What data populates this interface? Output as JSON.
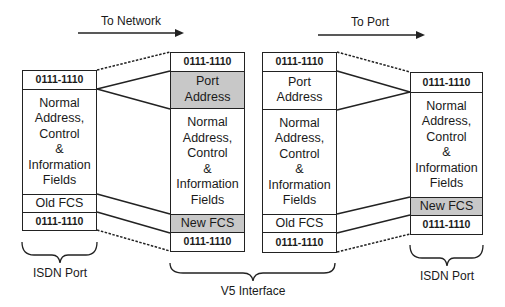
{
  "diagram": {
    "directions": [
      {
        "label": "To Network",
        "arrow": "right"
      },
      {
        "label": "To Port",
        "arrow": "right"
      }
    ],
    "frames": [
      {
        "name": "isdn-port-inbound",
        "fields": [
          {
            "label": "0111-1110",
            "type": "flag"
          },
          {
            "label": "Normal Address, Control & Information Fields",
            "lines": [
              "Normal",
              "Address,",
              "Control",
              "&",
              "Information",
              "Fields"
            ]
          },
          {
            "label": "Old FCS"
          },
          {
            "label": "0111-1110",
            "type": "flag"
          }
        ]
      },
      {
        "name": "v5-to-network",
        "fields": [
          {
            "label": "0111-1110",
            "type": "flag"
          },
          {
            "label": "Port Address",
            "lines": [
              "Port",
              "Address"
            ],
            "shaded": true
          },
          {
            "label": "Normal Address, Control & Information Fields",
            "lines": [
              "Normal",
              "Address,",
              "Control",
              "&",
              "Information",
              "Fields"
            ]
          },
          {
            "label": "New FCS",
            "shaded": true
          },
          {
            "label": "0111-1110",
            "type": "flag"
          }
        ]
      },
      {
        "name": "v5-to-port",
        "fields": [
          {
            "label": "0111-1110",
            "type": "flag"
          },
          {
            "label": "Port Address",
            "lines": [
              "Port",
              "Address"
            ]
          },
          {
            "label": "Normal Address, Control & Information Fields",
            "lines": [
              "Normal",
              "Address,",
              "Control",
              "&",
              "Information",
              "Fields"
            ]
          },
          {
            "label": "Old FCS"
          },
          {
            "label": "0111-1110",
            "type": "flag"
          }
        ]
      },
      {
        "name": "isdn-port-outbound",
        "fields": [
          {
            "label": "0111-1110",
            "type": "flag"
          },
          {
            "label": "Normal Address, Control & Information Fields",
            "lines": [
              "Normal",
              "Address,",
              "Control",
              "&",
              "Information",
              "Fields"
            ]
          },
          {
            "label": "New FCS",
            "shaded": true
          },
          {
            "label": "0111-1110",
            "type": "flag"
          }
        ]
      }
    ],
    "braces": [
      {
        "label": "ISDN Port"
      },
      {
        "label": "V5 Interface"
      },
      {
        "label": "ISDN Port"
      }
    ],
    "colors": {
      "shaded_field": "#c8c8c8",
      "line": "#222222"
    }
  }
}
